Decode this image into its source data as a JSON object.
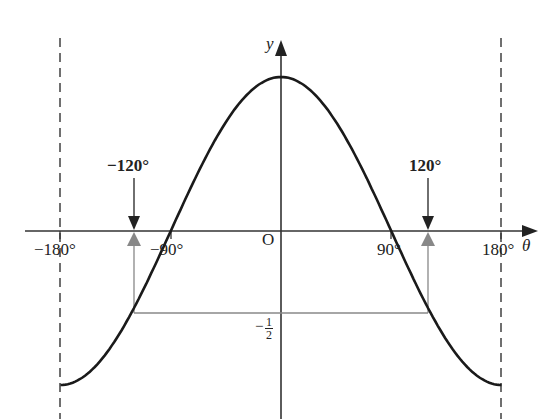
{
  "diagram": {
    "function": "y = cos(theta)",
    "x_axis": {
      "label": "θ",
      "ticks": [
        "−180°",
        "−90°",
        "90°",
        "180°"
      ],
      "origin_label": "O"
    },
    "y_axis": {
      "label": "y"
    },
    "markers": [
      {
        "label": "−120°",
        "value": -120
      },
      {
        "label": "120°",
        "value": 120
      }
    ],
    "horizontal_line": {
      "value": -0.5,
      "label_minus": "−",
      "label_num": "1",
      "label_den": "2"
    },
    "asymptote_lines": [
      -180,
      180
    ],
    "colors": {
      "curve": "#1a1a1a",
      "axis": "#333333",
      "guide": "#888888",
      "arrow_up": "#888888"
    }
  }
}
